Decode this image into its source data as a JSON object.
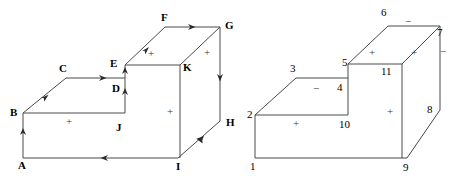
{
  "figure": {
    "title": "",
    "stroke_color": "#4a4a4a",
    "label_color": "#000000",
    "sign_color": "#3a3a3a",
    "background": "#ffffff"
  },
  "left_diagram": {
    "name": "lettered-staircase-solid",
    "vertex_labels": [
      {
        "id": "A",
        "text": "A",
        "x": 18,
        "y": 160
      },
      {
        "id": "B",
        "text": "B",
        "x": 10,
        "y": 107
      },
      {
        "id": "C",
        "text": "C",
        "x": 59,
        "y": 63
      },
      {
        "id": "D",
        "text": "D",
        "x": 112,
        "y": 83
      },
      {
        "id": "E",
        "text": "E",
        "x": 110,
        "y": 58
      },
      {
        "id": "F",
        "text": "F",
        "x": 161,
        "y": 12
      },
      {
        "id": "G",
        "text": "G",
        "x": 225,
        "y": 20
      },
      {
        "id": "H",
        "text": "H",
        "x": 226,
        "y": 117
      },
      {
        "id": "I",
        "text": "I",
        "x": 176,
        "y": 161
      },
      {
        "id": "J",
        "text": "J",
        "x": 116,
        "y": 122
      },
      {
        "id": "K",
        "text": "K",
        "x": 183,
        "y": 62
      }
    ],
    "face_signs": [
      {
        "text": "+",
        "x": 66,
        "y": 116
      },
      {
        "text": "+",
        "x": 148,
        "y": 48
      },
      {
        "text": "+",
        "x": 204,
        "y": 47
      },
      {
        "text": "+",
        "x": 167,
        "y": 106
      }
    ],
    "edge_arrow_count": 9
  },
  "right_diagram": {
    "name": "numbered-staircase-solid",
    "vertex_labels": [
      {
        "id": "1",
        "text": "1",
        "x": 250,
        "y": 161
      },
      {
        "id": "2",
        "text": "2",
        "x": 247,
        "y": 109
      },
      {
        "id": "3",
        "text": "3",
        "x": 290,
        "y": 63
      },
      {
        "id": "4",
        "text": "4",
        "x": 337,
        "y": 82
      },
      {
        "id": "5",
        "text": "5",
        "x": 342,
        "y": 57
      },
      {
        "id": "6",
        "text": "6",
        "x": 381,
        "y": 7
      },
      {
        "id": "7",
        "text": "7",
        "x": 437,
        "y": 27
      },
      {
        "id": "8",
        "text": "8",
        "x": 427,
        "y": 104
      },
      {
        "id": "9",
        "text": "9",
        "x": 403,
        "y": 162
      },
      {
        "id": "10",
        "text": "10",
        "x": 339,
        "y": 119
      },
      {
        "id": "11",
        "text": "11",
        "x": 381,
        "y": 66
      }
    ],
    "face_signs": [
      {
        "text": "+",
        "x": 293,
        "y": 118
      },
      {
        "text": "−",
        "x": 313,
        "y": 83
      },
      {
        "text": "+",
        "x": 369,
        "y": 47
      },
      {
        "text": "+",
        "x": 411,
        "y": 47
      },
      {
        "text": "−",
        "x": 405,
        "y": 16
      },
      {
        "text": "−",
        "x": 440,
        "y": 46
      },
      {
        "text": "+",
        "x": 387,
        "y": 106
      }
    ]
  }
}
